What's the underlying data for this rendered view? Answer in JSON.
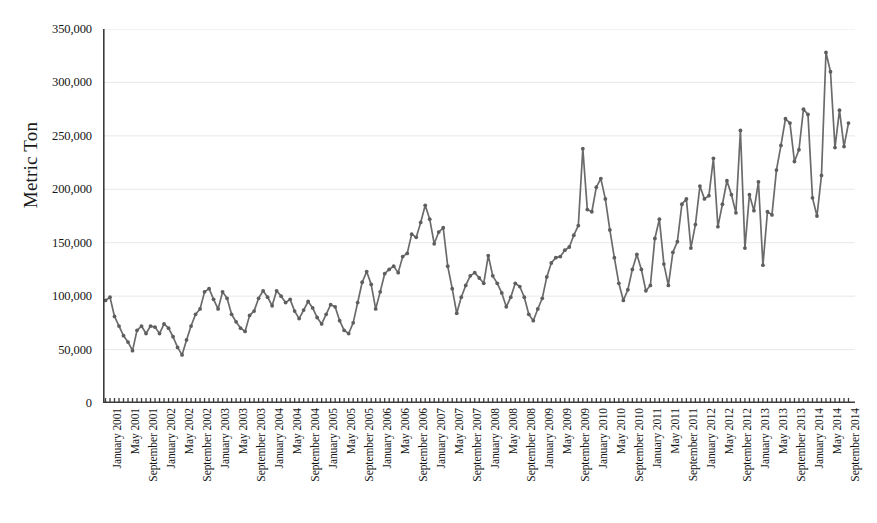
{
  "chart_data": {
    "type": "line",
    "title": "",
    "xlabel": "",
    "ylabel": "Metric Ton",
    "ylim": [
      0,
      350000
    ],
    "y_ticks": [
      0,
      50000,
      100000,
      150000,
      200000,
      250000,
      300000,
      350000
    ],
    "y_tick_labels": [
      "0",
      "50,000",
      "100,000",
      "150,000",
      "200,000",
      "250,000",
      "300,000",
      "350,000"
    ],
    "grid": true,
    "grid_axis": "y",
    "legend": false,
    "marker": "circle",
    "line_color": "#6b6b6b",
    "marker_color": "#5e5e5e",
    "axis_color": "#3c3c3c",
    "grid_color": "#e8e8ee",
    "x_tick_labels": [
      "January 2001",
      "May 2001",
      "September 2001",
      "January 2002",
      "May 2002",
      "September 2002",
      "January 2003",
      "May 2003",
      "September 2003",
      "January 2004",
      "May 2004",
      "September 2004",
      "January 2005",
      "May 2005",
      "September 2005",
      "January 2006",
      "May 2006",
      "September 2006",
      "January 2007",
      "May 2007",
      "September 2007",
      "January 2008",
      "May 2008",
      "September 2008",
      "January 2009",
      "May 2009",
      "September 2009",
      "January 2010",
      "May 2010",
      "September 2010",
      "January 2011",
      "May 2011",
      "September 2011",
      "January 2012",
      "May 2012",
      "September 2012",
      "January 2013",
      "May 2013",
      "September 2013",
      "January 2014",
      "May 2014",
      "September 2014"
    ],
    "x_tick_interval_months": 4,
    "x_start": "January 2001",
    "x_end": "October 2014",
    "n_points": 166,
    "values": [
      96000,
      99000,
      81000,
      72000,
      63000,
      57000,
      49000,
      68000,
      72000,
      65000,
      72000,
      71000,
      65000,
      74000,
      70000,
      62000,
      52000,
      45000,
      59000,
      72000,
      83000,
      88000,
      104000,
      107000,
      97000,
      88000,
      104000,
      98000,
      83000,
      76000,
      70000,
      67000,
      82000,
      86000,
      98000,
      105000,
      99000,
      91000,
      105000,
      100000,
      94000,
      97000,
      86000,
      79000,
      87000,
      95000,
      89000,
      80000,
      74000,
      83000,
      92000,
      90000,
      77000,
      68000,
      65000,
      75000,
      94000,
      113000,
      123000,
      111000,
      88000,
      104000,
      121000,
      125000,
      128000,
      122000,
      137000,
      140000,
      158000,
      155000,
      169000,
      185000,
      172000,
      149000,
      160000,
      164000,
      128000,
      107000,
      84000,
      99000,
      110000,
      119000,
      122000,
      117000,
      112000,
      138000,
      119000,
      112000,
      103000,
      90000,
      99000,
      112000,
      109000,
      99000,
      83000,
      77000,
      88000,
      98000,
      118000,
      131000,
      136000,
      137000,
      143000,
      146000,
      157000,
      166000,
      238000,
      181000,
      179000,
      202000,
      210000,
      191000,
      162000,
      136000,
      112000,
      96000,
      106000,
      125000,
      139000,
      125000,
      105000,
      110000,
      154000,
      172000,
      130000,
      110000,
      141000,
      151000,
      186000,
      191000,
      145000,
      167000,
      203000,
      191000,
      194000,
      229000,
      165000,
      186000,
      208000,
      195000,
      178000,
      255000,
      145000,
      195000,
      180000,
      207000,
      129000,
      179000,
      176000,
      218000,
      241000,
      266000,
      262000,
      226000,
      237000,
      275000,
      270000,
      192000,
      175000,
      213000,
      328000,
      310000,
      239000,
      274000,
      240000,
      262000
    ]
  },
  "axis": {
    "y_title": "Metric Ton"
  }
}
